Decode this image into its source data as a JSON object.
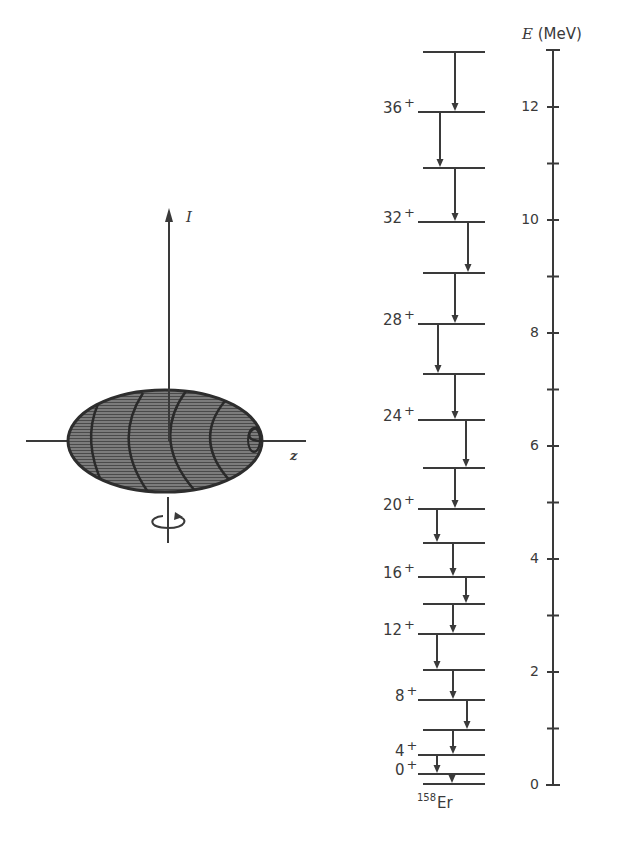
{
  "left_figure": {
    "description": "Prolate deformed nucleus rotating about axis perpendicular to symmetry axis",
    "rotation_axis_label": "I",
    "symmetry_axis_label": "z",
    "rotation_symbol": "rotation-arrow"
  },
  "level_scheme": {
    "nucleus_mass": "158",
    "nucleus_symbol": "Er",
    "spin_labels": [
      "36",
      "32",
      "28",
      "24",
      "20",
      "16",
      "12",
      "8",
      "4",
      "0"
    ],
    "parity": "+",
    "level_y_px": [
      52,
      112,
      168,
      222,
      273,
      324,
      374,
      420,
      468,
      509,
      543,
      577,
      604,
      634,
      670,
      700,
      730,
      755,
      774,
      784
    ]
  },
  "energy_axis": {
    "title_symbol": "E",
    "title_unit": "(MeV)",
    "tick_labels": [
      "12",
      "10",
      "8",
      "6",
      "4",
      "2",
      "0"
    ],
    "range": [
      0,
      13
    ],
    "colors": {
      "ink": "#3a3a3a",
      "fill": "#6a6a6a"
    }
  }
}
